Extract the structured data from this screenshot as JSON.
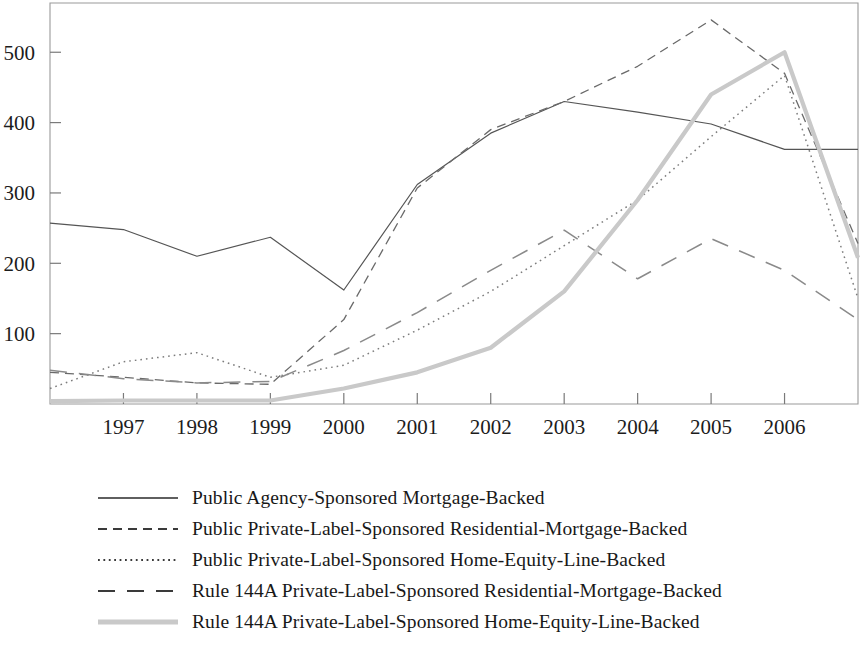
{
  "chart_data": {
    "type": "line",
    "title": "",
    "subtitle": "",
    "xlabel": "",
    "ylabel": "",
    "xlim": [
      1996,
      2007
    ],
    "ylim": [
      0,
      570
    ],
    "grid": false,
    "legend_position": "bottom-center",
    "x": [
      1996,
      1997,
      1998,
      1999,
      2000,
      2001,
      2002,
      2003,
      2004,
      2005,
      2006,
      2007
    ],
    "xtick_labels": [
      "1997",
      "1998",
      "1999",
      "2000",
      "2001",
      "2002",
      "2003",
      "2004",
      "2005",
      "2006"
    ],
    "xtick_values": [
      1997,
      1998,
      1999,
      2000,
      2001,
      2002,
      2003,
      2004,
      2005,
      2006
    ],
    "ytick_labels": [
      "100",
      "200",
      "300",
      "400",
      "500"
    ],
    "ytick_values": [
      100,
      200,
      300,
      400,
      500
    ],
    "series": [
      {
        "name": "Public Agency-Sponsored Mortgage-Backed",
        "style": "solid",
        "color": "#555555",
        "values": [
          257,
          248,
          210,
          237,
          162,
          312,
          385,
          430,
          415,
          398,
          362,
          362
        ]
      },
      {
        "name": "Public Private-Label-Sponsored Residential-Mortgage-Backed",
        "style": "dashed",
        "color": "#6a6a6a",
        "values": [
          45,
          38,
          30,
          28,
          120,
          307,
          390,
          430,
          480,
          546,
          470,
          228
        ]
      },
      {
        "name": "Public Private-Label-Sponsored Home-Equity-Line-Backed",
        "style": "dotted",
        "color": "#7d7d7d",
        "values": [
          22,
          60,
          73,
          38,
          55,
          105,
          160,
          225,
          290,
          380,
          467,
          150
        ]
      },
      {
        "name": "Rule 144A Private-Label-Sponsored Residential-Mortgage-Backed",
        "style": "longdash",
        "color": "#8a8a8a",
        "values": [
          48,
          36,
          30,
          32,
          76,
          130,
          190,
          247,
          178,
          235,
          190,
          120
        ]
      },
      {
        "name": "Rule 144A Private-Label-Sponsored Home-Equity-Line-Backed",
        "style": "thick-solid",
        "color": "#c9c9c9",
        "values": [
          4,
          5,
          5,
          5,
          22,
          45,
          80,
          160,
          290,
          440,
          500,
          208
        ]
      }
    ]
  },
  "axes": {
    "frame_color": "#9a9a9a",
    "tick_color": "#7a7a7a"
  },
  "legend": {
    "items": [
      {
        "label": "Public Agency-Sponsored Mortgage-Backed",
        "style": "solid"
      },
      {
        "label": "Public Private-Label-Sponsored Residential-Mortgage-Backed",
        "style": "dashed"
      },
      {
        "label": "Public Private-Label-Sponsored Home-Equity-Line-Backed",
        "style": "dotted"
      },
      {
        "label": "Rule 144A Private-Label-Sponsored Residential-Mortgage-Backed",
        "style": "longdash"
      },
      {
        "label": "Rule 144A Private-Label-Sponsored Home-Equity-Line-Backed",
        "style": "thick-solid"
      }
    ]
  }
}
